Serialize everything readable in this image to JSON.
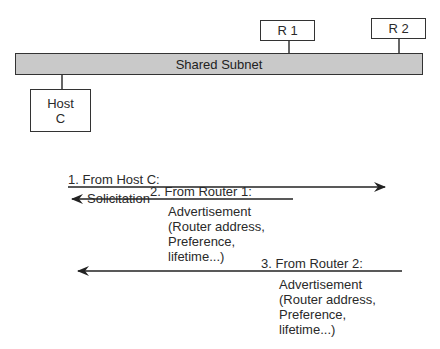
{
  "diagram": {
    "subnet": {
      "label": "Shared Subnet",
      "fill": "#c9c9c9"
    },
    "nodes": {
      "router1": {
        "label": "R 1"
      },
      "router2": {
        "label": "R 2"
      },
      "host": {
        "line1": "Host",
        "line2": "C"
      }
    },
    "messages": [
      {
        "step": "1. From Host C:",
        "body": [
          "Solicitation"
        ],
        "direction": "right"
      },
      {
        "step": "2. From Router 1:",
        "body": [
          "Advertisement",
          "(Router address,",
          "Preference,",
          "lifetime...)"
        ],
        "direction": "left"
      },
      {
        "step": "3. From Router 2:",
        "body": [
          "Advertisement",
          "(Router address,",
          "Preference,",
          "lifetime...)"
        ],
        "direction": "left"
      }
    ]
  }
}
